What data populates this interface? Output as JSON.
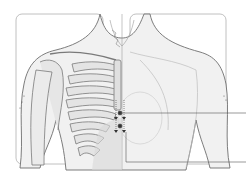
{
  "figure": {
    "colors": {
      "background": "#ffffff",
      "frame": "#9a9a9a",
      "outline": "#6e6e6e",
      "bone_fill": "#e9e9e9",
      "shade": "#d4d4d4",
      "marker": "#333333",
      "leader_line": "#555555"
    },
    "markers": [
      {
        "label": "",
        "x": 120,
        "y": 113
      },
      {
        "label": "",
        "x": 120,
        "y": 126
      }
    ],
    "leader_lines": [
      {
        "from_x": 120,
        "y": 113,
        "to_x": 246
      },
      {
        "from_x": 126,
        "y": 162,
        "to_x": 246
      }
    ]
  }
}
